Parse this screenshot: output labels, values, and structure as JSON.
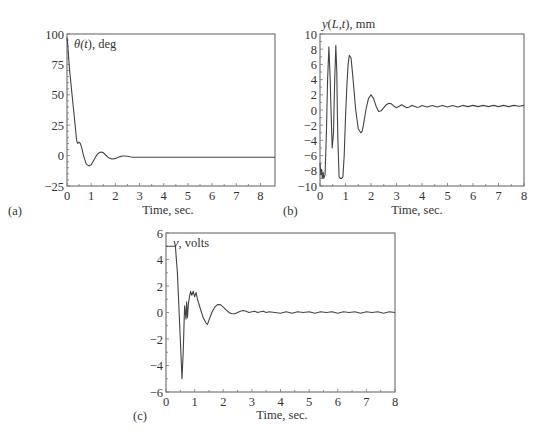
{
  "chart_data": [
    {
      "id": "a",
      "type": "line",
      "panel_label": "(a)",
      "title": "",
      "ylabel_parts": [
        {
          "text": "θ(",
          "italic": true
        },
        {
          "text": "t",
          "italic": true
        },
        {
          "text": "), deg",
          "italic": false
        }
      ],
      "xlabel": "Time, sec.",
      "xlim": [
        0,
        8.6
      ],
      "ylim": [
        -25,
        100
      ],
      "xticks": [
        0,
        1,
        2,
        3,
        4,
        5,
        6,
        7,
        8
      ],
      "xtick_labels": [
        "0",
        "1",
        "2",
        "3",
        "4",
        "5",
        "6",
        "7",
        "8"
      ],
      "yticks": [
        -25,
        0,
        25,
        50,
        75,
        100
      ],
      "ytick_labels": [
        "−25",
        "0",
        "25",
        "50",
        "75",
        "100"
      ],
      "grid": false,
      "series": [
        {
          "name": "theta",
          "x": [
            0,
            0.03,
            0.1,
            0.2,
            0.3,
            0.4,
            0.45,
            0.5,
            0.55,
            0.6,
            0.7,
            0.8,
            0.9,
            1.0,
            1.1,
            1.2,
            1.3,
            1.4,
            1.5,
            1.6,
            1.7,
            1.8,
            1.9,
            2.0,
            2.1,
            2.2,
            2.3,
            2.4,
            2.5,
            2.6,
            2.7,
            3.0,
            8.6
          ],
          "y": [
            97,
            92,
            72,
            52,
            32,
            12,
            10,
            11,
            10,
            7,
            -1,
            -7,
            -8.5,
            -7.5,
            -4,
            -0.5,
            2,
            3,
            2.5,
            0.5,
            -1.5,
            -2.5,
            -2.8,
            -2.3,
            -1.5,
            -0.8,
            -0.3,
            -0.3,
            -0.6,
            -1,
            -1.3,
            -1.3,
            -1.3
          ]
        }
      ]
    },
    {
      "id": "b",
      "type": "line",
      "panel_label": "(b)",
      "title": "",
      "ylabel_parts": [
        {
          "text": "y",
          "italic": true
        },
        {
          "text": "(",
          "italic": false
        },
        {
          "text": "L",
          "italic": true
        },
        {
          "text": ",",
          "italic": false
        },
        {
          "text": "t",
          "italic": true
        },
        {
          "text": "), mm",
          "italic": false
        }
      ],
      "xlabel": "Time, sec.",
      "xlim": [
        0,
        8
      ],
      "ylim": [
        -10,
        10
      ],
      "xticks": [
        0,
        1,
        2,
        3,
        4,
        5,
        6,
        7,
        8
      ],
      "xtick_labels": [
        "0",
        "1",
        "2",
        "3",
        "4",
        "5",
        "6",
        "7",
        "8"
      ],
      "yticks": [
        -10,
        -8,
        -6,
        -4,
        -2,
        0,
        2,
        4,
        6,
        8,
        10
      ],
      "ytick_labels": [
        "−10",
        "−8",
        "−6",
        "−4",
        "−2",
        "0",
        "2",
        "4",
        "6",
        "8",
        "10"
      ],
      "grid": false,
      "series": [
        {
          "name": "tip deflection",
          "x": [
            0,
            0.03,
            0.06,
            0.09,
            0.12,
            0.15,
            0.2,
            0.25,
            0.3,
            0.35,
            0.4,
            0.43,
            0.48,
            0.53,
            0.57,
            0.62,
            0.66,
            0.68,
            0.7,
            0.75,
            0.8,
            0.85,
            0.9,
            0.95,
            1.0,
            1.05,
            1.1,
            1.15,
            1.22,
            1.3,
            1.4,
            1.5,
            1.6,
            1.65,
            1.7,
            1.8,
            1.9,
            2.0,
            2.1,
            2.2,
            2.3,
            2.4,
            2.5,
            2.6,
            2.7,
            2.8,
            2.9,
            3.0,
            3.1,
            3.2,
            3.3,
            3.4,
            3.5,
            3.6,
            3.7,
            3.8,
            3.9,
            4.0,
            4.2,
            4.4,
            4.6,
            4.8,
            5.0,
            5.2,
            5.4,
            5.6,
            5.8,
            6.0,
            6.2,
            6.4,
            6.6,
            6.8,
            7.0,
            7.2,
            7.4,
            7.6,
            7.8,
            8.0
          ],
          "y": [
            -7,
            -8.5,
            -7.8,
            -9,
            -8.2,
            -9,
            -8.5,
            -3,
            4,
            8.3,
            4,
            0,
            -5,
            -3,
            3,
            8.5,
            5,
            0,
            -4,
            -8.8,
            -9,
            -9,
            -8.8,
            -6,
            -1,
            3,
            6,
            7.2,
            6.8,
            4,
            0,
            -2.5,
            -3,
            -2.8,
            -2,
            0,
            1.5,
            2,
            1.5,
            0.5,
            -0.2,
            -0.1,
            0.3,
            0.7,
            0.9,
            0.8,
            0.5,
            0.3,
            0.5,
            0.7,
            0.5,
            0.3,
            0.4,
            0.6,
            0.5,
            0.35,
            0.4,
            0.6,
            0.4,
            0.6,
            0.4,
            0.6,
            0.4,
            0.6,
            0.4,
            0.6,
            0.45,
            0.6,
            0.45,
            0.6,
            0.45,
            0.6,
            0.45,
            0.6,
            0.45,
            0.6,
            0.5,
            0.6
          ]
        }
      ]
    },
    {
      "id": "c",
      "type": "line",
      "panel_label": "(c)",
      "title": "",
      "ylabel_parts": [
        {
          "text": "v",
          "italic": true
        },
        {
          "text": ", volts",
          "italic": false
        }
      ],
      "xlabel": "Time, sec.",
      "xlim": [
        0,
        8
      ],
      "ylim": [
        -6,
        6
      ],
      "xticks": [
        0,
        1,
        2,
        3,
        4,
        5,
        6,
        7,
        8
      ],
      "xtick_labels": [
        "0",
        "1",
        "2",
        "3",
        "4",
        "5",
        "6",
        "7",
        "8"
      ],
      "yticks": [
        -6,
        -4,
        -2,
        0,
        2,
        4,
        6
      ],
      "ytick_labels": [
        "−6",
        "−4",
        "−2",
        "0",
        "2",
        "4",
        "6"
      ],
      "grid": false,
      "series": [
        {
          "name": "voltage",
          "x": [
            0,
            0.3,
            0.33,
            0.4,
            0.5,
            0.56,
            0.6,
            0.65,
            0.7,
            0.72,
            0.75,
            0.78,
            0.82,
            0.86,
            0.9,
            0.95,
            1.0,
            1.05,
            1.1,
            1.2,
            1.3,
            1.4,
            1.45,
            1.5,
            1.6,
            1.7,
            1.8,
            1.9,
            2.0,
            2.1,
            2.2,
            2.3,
            2.4,
            2.5,
            2.6,
            2.7,
            2.8,
            2.9,
            3.0,
            3.1,
            3.2,
            3.3,
            3.4,
            3.5,
            3.6,
            3.8,
            4.0,
            4.2,
            4.4,
            4.6,
            4.8,
            5.0,
            5.2,
            5.4,
            5.6,
            5.8,
            6.0,
            6.2,
            6.4,
            6.6,
            6.8,
            7.0,
            7.2,
            7.4,
            7.6,
            7.8,
            8.0
          ],
          "y": [
            5,
            5,
            5,
            3,
            -2,
            -5,
            -3,
            0.5,
            -0.5,
            0.8,
            -0.4,
            0.6,
            1.2,
            1.6,
            1.3,
            1.6,
            1.2,
            1.5,
            1.0,
            0.3,
            -0.4,
            -0.8,
            -0.9,
            -0.6,
            0,
            0.4,
            0.6,
            0.6,
            0.4,
            0.2,
            0,
            -0.1,
            -0.1,
            0,
            0.1,
            0.15,
            0.1,
            0,
            0.05,
            0.1,
            0,
            0.05,
            0.1,
            0,
            0.05,
            0,
            -0.05,
            0.05,
            -0.05,
            0.05,
            0,
            0.05,
            -0.05,
            0.05,
            0,
            0.05,
            -0.05,
            0.05,
            0,
            0.05,
            -0.05,
            0.05,
            0,
            0.05,
            -0.05,
            0.05,
            0
          ]
        }
      ]
    }
  ]
}
